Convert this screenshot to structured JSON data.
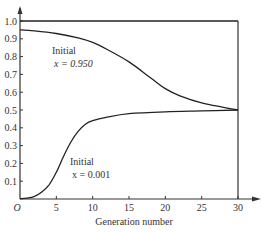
{
  "chart_data": {
    "type": "line",
    "title": "",
    "xlabel": "Generation number",
    "ylabel": "",
    "xlim": [
      0,
      30
    ],
    "ylim": [
      0,
      1.0
    ],
    "x_ticks": [
      "O",
      "5",
      "10",
      "15",
      "20",
      "25",
      "30"
    ],
    "y_ticks": [
      "0.1",
      "0.2",
      "0.3",
      "0.4",
      "0.5",
      "0.6",
      "0.7",
      "0.8",
      "0.9",
      "1.0"
    ],
    "grid": false,
    "series": [
      {
        "name": "Initial x = 0.950",
        "x": [
          0,
          2,
          5,
          8,
          10,
          12,
          15,
          18,
          20,
          22,
          25,
          28,
          30
        ],
        "values": [
          0.95,
          0.945,
          0.93,
          0.905,
          0.88,
          0.84,
          0.77,
          0.68,
          0.62,
          0.58,
          0.54,
          0.515,
          0.5
        ]
      },
      {
        "name": "Initial x = 0.001",
        "x": [
          0,
          1,
          2,
          3,
          4,
          5,
          6,
          7,
          8,
          9,
          10,
          12,
          15,
          20,
          25,
          30
        ],
        "values": [
          0.001,
          0.005,
          0.015,
          0.04,
          0.08,
          0.15,
          0.24,
          0.32,
          0.38,
          0.42,
          0.44,
          0.46,
          0.48,
          0.49,
          0.495,
          0.5
        ]
      },
      {
        "name": "x = 1.0 line",
        "x": [
          0,
          30
        ],
        "values": [
          1.0,
          1.0
        ]
      }
    ],
    "annotations": [
      {
        "text": "Initial",
        "text2": "x = 0.950"
      },
      {
        "text": "Initial",
        "text2": "x = 0.001"
      }
    ]
  },
  "labels": {
    "origin": "O",
    "xlabel": "Generation number",
    "ann_upper_1": "Initial",
    "ann_upper_2": "x = 0.950",
    "ann_lower_1": "Initial",
    "ann_lower_2": "x = 0.001"
  }
}
